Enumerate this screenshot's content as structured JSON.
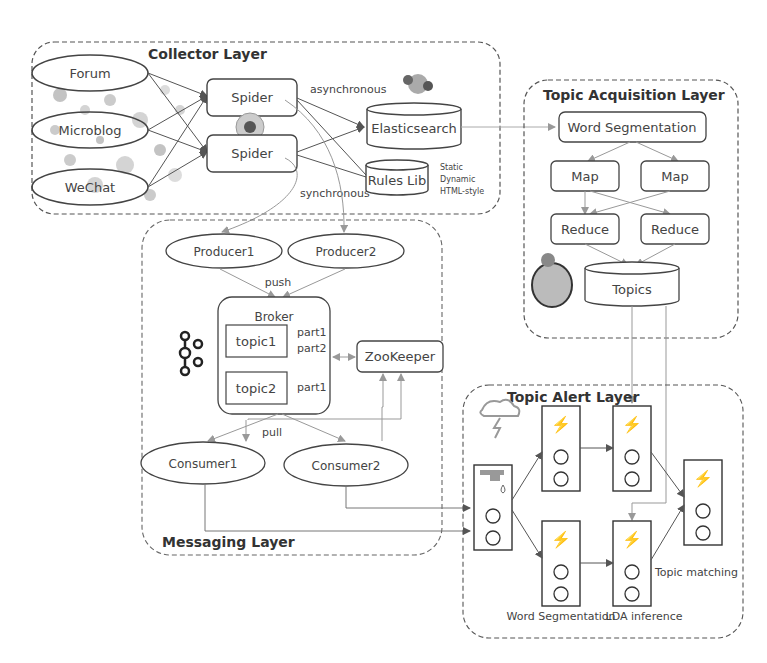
{
  "collector_layer": {
    "title": "Collector Layer",
    "sources": [
      "Forum",
      "Microblog",
      "WeChat"
    ],
    "spiders": [
      "Spider",
      "Spider"
    ],
    "labels": {
      "asynchronous": "asynchronous",
      "synchronous": "synchronous"
    },
    "elasticsearch": "Elasticsearch",
    "rules_lib": "Rules Lib",
    "rules_notes": [
      "Static",
      "Dynamic",
      "HTML-style"
    ]
  },
  "topic_acquisition_layer": {
    "title": "Topic Acquisition Layer",
    "word_segmentation": "Word Segmentation",
    "maps": [
      "Map",
      "Map"
    ],
    "reduces": [
      "Reduce",
      "Reduce"
    ],
    "topics": "Topics"
  },
  "messaging_layer": {
    "title": "Messaging Layer",
    "producers": [
      "Producer1",
      "Producer2"
    ],
    "push": "push",
    "broker": "Broker",
    "topic1": "topic1",
    "topic1_parts": [
      "part1",
      "part2"
    ],
    "topic2": "topic2",
    "topic2_parts": [
      "part1"
    ],
    "zookeeper": "ZooKeeper",
    "pull": "pull",
    "consumers": [
      "Consumer1",
      "Consumer2"
    ]
  },
  "topic_alert_layer": {
    "title": "Topic Alert Layer",
    "labels": {
      "word_segmentation": "Word Segmentation",
      "lda_inference": "LDA inference",
      "topic_matching": "Topic matching"
    }
  }
}
